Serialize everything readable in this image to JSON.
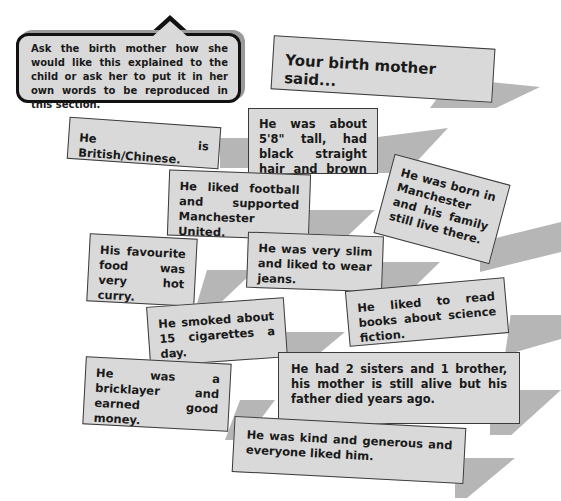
{
  "instruction_bubble": {
    "text": "Ask the birth mother how she would like this explained to the child or ask her to put it in her own words to be reproduced in this section."
  },
  "title": "Your birth mother said...",
  "cards": [
    {
      "id": "heritage",
      "text": "He is British/Chinese."
    },
    {
      "id": "appearance",
      "text": "He was about 5'8\" tall, had black straight hair and brown eyes."
    },
    {
      "id": "football",
      "text": "He liked football and supported Manchester United."
    },
    {
      "id": "birthplace",
      "text": "He was born in Manchester and his family still live there."
    },
    {
      "id": "food",
      "text": "His favourite food was very hot curry."
    },
    {
      "id": "build",
      "text": "He was very slim and liked to wear jeans."
    },
    {
      "id": "books",
      "text": "He liked to read books about science fiction."
    },
    {
      "id": "smoking",
      "text": "He smoked about 15 cigarettes a day."
    },
    {
      "id": "job",
      "text": "He was a bricklayer and earned good money."
    },
    {
      "id": "family",
      "text": "He had 2 sisters and 1 brother, his mother is still alive but his father died years ago."
    },
    {
      "id": "personality",
      "text": "He was kind and generous and everyone liked him."
    }
  ],
  "colors": {
    "card_fill": "#d9d9d9",
    "card_border": "#3a3a3a",
    "shadow": "#a9a9a9",
    "text": "#1a1a1a"
  }
}
